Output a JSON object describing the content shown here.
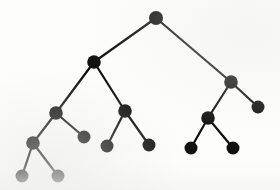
{
  "figure": {
    "background_color": "#fdfdfc",
    "node_color": "#111111",
    "edge_color": "#0d0d0d",
    "width": 280,
    "height": 190
  },
  "chart_data": {
    "type": "diagram",
    "diagram_kind": "binary-tree",
    "title": "",
    "xlabel": "",
    "ylabel": "",
    "node_radius": 6.5,
    "root_radius": 7,
    "edge_width": 2.2,
    "node_count": 15,
    "edge_count": 14,
    "depth": 5,
    "nodes": [
      {
        "id": "root",
        "x": 156,
        "y": 18,
        "r": 7,
        "depth": 0,
        "label": ""
      },
      {
        "id": "L",
        "x": 94,
        "y": 62,
        "r": 6.8,
        "depth": 1,
        "label": ""
      },
      {
        "id": "R",
        "x": 231,
        "y": 82,
        "r": 6.8,
        "depth": 1,
        "label": ""
      },
      {
        "id": "LL",
        "x": 56,
        "y": 113,
        "r": 6.8,
        "depth": 2,
        "label": ""
      },
      {
        "id": "LR",
        "x": 125,
        "y": 111,
        "r": 6.8,
        "depth": 2,
        "label": ""
      },
      {
        "id": "RL",
        "x": 208,
        "y": 118,
        "r": 6.8,
        "depth": 2,
        "label": ""
      },
      {
        "id": "RR",
        "x": 258,
        "y": 107,
        "r": 6.5,
        "depth": 2,
        "label": ""
      },
      {
        "id": "LLL",
        "x": 33,
        "y": 143,
        "r": 6.8,
        "depth": 3,
        "label": ""
      },
      {
        "id": "LLR",
        "x": 84,
        "y": 137,
        "r": 6.5,
        "depth": 3,
        "label": ""
      },
      {
        "id": "LRL",
        "x": 107,
        "y": 146,
        "r": 6.5,
        "depth": 3,
        "label": ""
      },
      {
        "id": "LRR",
        "x": 149,
        "y": 145,
        "r": 6.5,
        "depth": 3,
        "label": ""
      },
      {
        "id": "RLL",
        "x": 191,
        "y": 148,
        "r": 6.5,
        "depth": 3,
        "label": ""
      },
      {
        "id": "RLR",
        "x": 233,
        "y": 148,
        "r": 6.5,
        "depth": 3,
        "label": ""
      },
      {
        "id": "LLLL",
        "x": 22,
        "y": 176,
        "r": 6.5,
        "depth": 4,
        "label": ""
      },
      {
        "id": "LLLR",
        "x": 58,
        "y": 176,
        "r": 6.5,
        "depth": 4,
        "label": ""
      }
    ],
    "edges": [
      {
        "from": "root",
        "to": "L"
      },
      {
        "from": "root",
        "to": "R"
      },
      {
        "from": "L",
        "to": "LL"
      },
      {
        "from": "L",
        "to": "LR"
      },
      {
        "from": "R",
        "to": "RL"
      },
      {
        "from": "R",
        "to": "RR"
      },
      {
        "from": "LL",
        "to": "LLL"
      },
      {
        "from": "LL",
        "to": "LLR"
      },
      {
        "from": "LR",
        "to": "LRL"
      },
      {
        "from": "LR",
        "to": "LRR"
      },
      {
        "from": "RL",
        "to": "RLL"
      },
      {
        "from": "RL",
        "to": "RLR"
      },
      {
        "from": "LLL",
        "to": "LLLL"
      },
      {
        "from": "LLL",
        "to": "LLLR"
      }
    ]
  }
}
